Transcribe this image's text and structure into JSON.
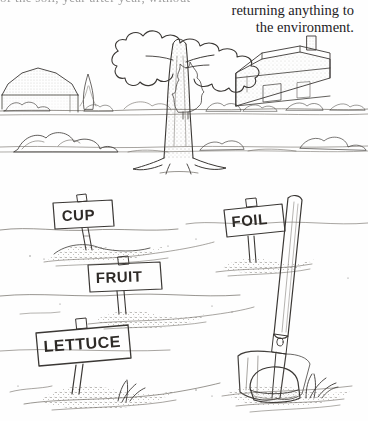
{
  "page": {
    "background_color": "#fefefe",
    "ink_color": "#3a3734",
    "cropped_top_line": "of the soil, year after year, without"
  },
  "body_text": {
    "lines": [
      "returning anything to",
      "the environment."
    ]
  },
  "top_illustration": {
    "name": "landscape-with-tree",
    "caption_alt": "Pen and ink landscape: a large bare tree in a field with a barn at left and a farmhouse with chimney and evergreen tree at right",
    "elements": [
      "large-deciduous-tree",
      "barn-left",
      "farmhouse-right",
      "chimney",
      "evergreen-tree",
      "hedgerow",
      "shrubs",
      "horizon-line"
    ]
  },
  "bottom_illustration": {
    "name": "garden-plot-with-labeled-signs",
    "caption_alt": "Pen and ink drawing of a garden plot with four hand lettered stake signs, a spade stuck in the soil, and a slice of bread on the ground",
    "signs": [
      {
        "label": "CUP",
        "x": 78,
        "y": 208,
        "rotation": -5
      },
      {
        "label": "FOIL",
        "x": 252,
        "y": 222,
        "rotation": -7
      },
      {
        "label": "FRUIT",
        "x": 122,
        "y": 280,
        "rotation": -3
      },
      {
        "label": "LETTUCE",
        "x": 82,
        "y": 350,
        "rotation": -6
      }
    ],
    "objects": [
      "spade",
      "bread-slice",
      "soil-mounds",
      "grass-tufts"
    ]
  }
}
